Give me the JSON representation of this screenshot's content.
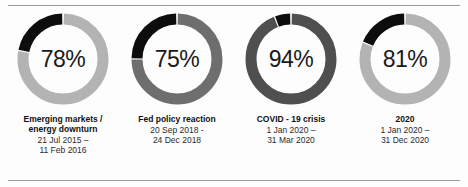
{
  "chart_data": {
    "type": "pie",
    "title": "",
    "subtitle": "",
    "legend_position": "none",
    "grid": false,
    "units": "percent",
    "note": "Four donut gauges. Grey arc (clockwise from 12 o'clock) encodes the labelled percentage; black arc (counter-clockwise from 12 o'clock) encodes the remainder.",
    "categories": [
      "Emerging markets / energy downturn",
      "Fed policy reaction",
      "COVID - 19 crisis",
      "2020"
    ],
    "values": [
      78,
      75,
      94,
      81
    ],
    "remainders": [
      22,
      25,
      6,
      19
    ],
    "series": [
      {
        "name": "Share",
        "values": [
          78,
          75,
          94,
          81
        ]
      },
      {
        "name": "Remainder",
        "values": [
          22,
          25,
          6,
          19
        ]
      }
    ]
  },
  "colors": {
    "black_arc": "#0d0d0d",
    "track_1": "#b3b3b3",
    "track_2": "#6e6e6e",
    "track_3": "#4f4f4f",
    "track_4": "#b3b3b3",
    "rule": "#9a9a9a",
    "value_text": "#1a1a1a",
    "caption_text": "#111111"
  },
  "panels": [
    {
      "value_label": "78%",
      "percent": 78,
      "remainder": 22,
      "title": "Emerging markets  /\nenergy downturn",
      "dates": "21 Jul 2015  –\n11 Feb 2016",
      "date_start": "21 Jul 2015",
      "date_end": "11 Feb 2016",
      "track_color": "#b3b3b3"
    },
    {
      "value_label": "75%",
      "percent": 75,
      "remainder": 25,
      "title": "Fed policy reaction",
      "dates": "20 Sep 2018  -\n24 Dec 2018",
      "date_start": "20 Sep 2018",
      "date_end": "24 Dec 2018",
      "track_color": "#6e6e6e"
    },
    {
      "value_label": "94%",
      "percent": 94,
      "remainder": 6,
      "title": "COVID - 19 crisis",
      "dates": "1 Jan 2020  –\n31 Mar 2020",
      "date_start": "1 Jan 2020",
      "date_end": "31 Mar 2020",
      "track_color": "#4f4f4f"
    },
    {
      "value_label": "81%",
      "percent": 81,
      "remainder": 19,
      "title": "2020",
      "dates": "1 Jan 2020  –\n31 Dec 2020",
      "date_start": "1 Jan 2020",
      "date_end": "31 Dec 2020",
      "track_color": "#b3b3b3"
    }
  ]
}
